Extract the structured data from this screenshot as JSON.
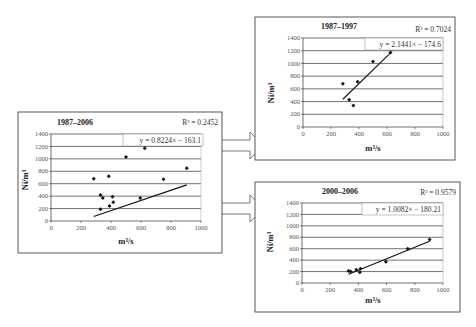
{
  "chart_data": [
    {
      "id": "left",
      "type": "scatter",
      "title": "1987–2006",
      "xlabel": "m³/s",
      "ylabel": "Ni/m³",
      "xlim": [
        0,
        1000
      ],
      "ylim": [
        0,
        1400
      ],
      "xticks": [
        0,
        200,
        400,
        600,
        800,
        1000
      ],
      "yticks": [
        0,
        200,
        400,
        600,
        800,
        1000,
        1200,
        1400
      ],
      "grid": true,
      "points": [
        [
          285,
          680
        ],
        [
          330,
          420
        ],
        [
          345,
          370
        ],
        [
          330,
          190
        ],
        [
          385,
          720
        ],
        [
          390,
          240
        ],
        [
          410,
          390
        ],
        [
          415,
          300
        ],
        [
          500,
          1030
        ],
        [
          595,
          370
        ],
        [
          625,
          1170
        ],
        [
          750,
          670
        ],
        [
          905,
          850
        ]
      ],
      "trendline": {
        "slope": 0.8224,
        "intercept": -163.1,
        "x_range": [
          285,
          905
        ]
      },
      "equation": "y = 0.8224× − 163.1",
      "r2": "R² = 0.2452"
    },
    {
      "id": "top-right",
      "type": "scatter",
      "title": "1987–1997",
      "xlabel": "m³/s",
      "ylabel": "Ni/m³",
      "xlim": [
        0,
        1000
      ],
      "ylim": [
        0,
        1400
      ],
      "xticks": [
        0,
        200,
        400,
        600,
        800,
        1000
      ],
      "yticks": [
        0,
        200,
        400,
        600,
        800,
        1000,
        1200,
        1400
      ],
      "grid": true,
      "points": [
        [
          285,
          680
        ],
        [
          330,
          430
        ],
        [
          360,
          340
        ],
        [
          390,
          710
        ],
        [
          500,
          1030
        ],
        [
          625,
          1170
        ]
      ],
      "trendline": {
        "slope": 2.1441,
        "intercept": -174.6,
        "x_range": [
          285,
          625
        ]
      },
      "equation": "y = 2.1441× − 174.6",
      "r2": "R² = 0.7024"
    },
    {
      "id": "bottom-right",
      "type": "scatter",
      "title": "2000–2006",
      "xlabel": "m³/s",
      "ylabel": "Ni/m³",
      "xlim": [
        0,
        1000
      ],
      "ylim": [
        0,
        1400
      ],
      "xticks": [
        0,
        200,
        400,
        600,
        800,
        1000
      ],
      "yticks": [
        0,
        200,
        400,
        600,
        800,
        1000,
        1200,
        1400
      ],
      "grid": true,
      "points": [
        [
          330,
          210
        ],
        [
          345,
          200
        ],
        [
          385,
          230
        ],
        [
          410,
          190
        ],
        [
          415,
          250
        ],
        [
          595,
          370
        ],
        [
          750,
          600
        ],
        [
          905,
          760
        ]
      ],
      "trendline": {
        "slope": 1.0082,
        "intercept": -180.21,
        "x_range": [
          330,
          905
        ]
      },
      "equation": "y = 1.0082× − 180.21",
      "r2": "R² = 0.9579"
    }
  ],
  "layout": {
    "charts": [
      {
        "box": [
          18,
          112,
          204,
          141
        ],
        "plot": {
          "x0": 51,
          "x1": 201,
          "y0": 221,
          "y1": 134
        },
        "title_pos": [
          75,
          125
        ],
        "r2_pos": [
          218,
          125
        ],
        "eq_box": [
          123,
          134,
          80,
          12
        ],
        "ylabel_pos": [
          28,
          180
        ],
        "xlabel_pos": [
          126,
          244
        ],
        "tick_font": 6.5
      },
      {
        "box": [
          255,
          17,
          200,
          143
        ],
        "plot": {
          "x0": 303,
          "x1": 443,
          "y0": 127,
          "y1": 38
        },
        "title_pos": [
          339,
          29
        ],
        "r2_pos": [
          451,
          32
        ],
        "eq_box": [
          365,
          38,
          78,
          12
        ],
        "ylabel_pos": [
          274,
          93
        ],
        "xlabel_pos": [
          373,
          151
        ],
        "tick_font": 6.5
      },
      {
        "box": [
          255,
          182,
          205,
          130
        ],
        "plot": {
          "x0": 302,
          "x1": 443,
          "y0": 283,
          "y1": 203
        },
        "title_pos": [
          340,
          194
        ],
        "r2_pos": [
          456,
          195
        ],
        "eq_box": [
          362,
          203,
          81,
          12
        ],
        "ylabel_pos": [
          273,
          242
        ],
        "xlabel_pos": [
          373,
          303
        ],
        "tick_font": 6.5
      }
    ],
    "arrows": [
      {
        "x": 217,
        "y": 140,
        "body_w": 33,
        "body_h": 11,
        "head_w": 13,
        "head_h": 27
      },
      {
        "x": 217,
        "y": 203,
        "body_w": 33,
        "body_h": 11,
        "head_w": 13,
        "head_h": 27
      }
    ]
  }
}
